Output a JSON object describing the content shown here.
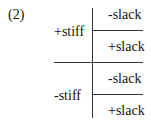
{
  "diagram": {
    "label": "(2)",
    "branches": [
      {
        "label": "+stiff",
        "children": [
          "-slack",
          "+slack"
        ]
      },
      {
        "label": "-stiff",
        "children": [
          "-slack",
          "+slack"
        ]
      }
    ]
  }
}
